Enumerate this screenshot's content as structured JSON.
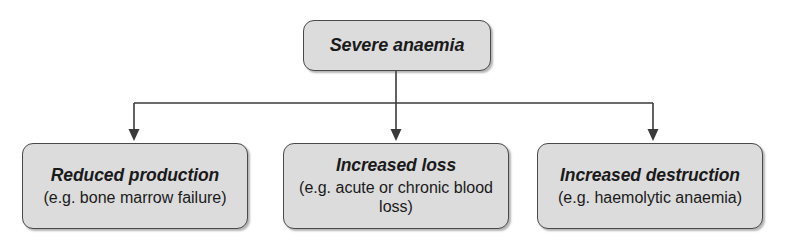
{
  "diagram": {
    "colors": {
      "node_fill": "#dcdcdc",
      "node_border": "#4a4a4a",
      "connector": "#3a3a3a",
      "text": "#1a1a1a"
    },
    "root": {
      "title": "Severe anaemia",
      "subtitle": ""
    },
    "branches": [
      {
        "title": "Reduced production",
        "subtitle": "(e.g. bone marrow failure)"
      },
      {
        "title": "Increased loss",
        "subtitle": "(e.g. acute or chronic blood loss)"
      },
      {
        "title": "Increased destruction",
        "subtitle": "(e.g. haemolytic anaemia)"
      }
    ]
  }
}
